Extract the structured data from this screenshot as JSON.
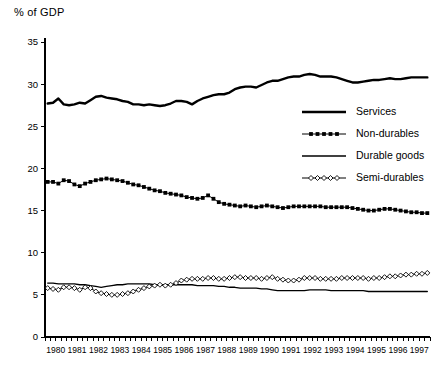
{
  "chart_data": {
    "type": "line",
    "title": "% of GDP",
    "xlabel": "",
    "ylabel": "% of GDP",
    "ylim": [
      0,
      35
    ],
    "yticks": [
      0,
      5,
      10,
      15,
      20,
      25,
      30,
      35
    ],
    "grid": false,
    "legend_position": "right-middle",
    "xtick_labels": [
      "1980",
      "1981",
      "1982",
      "1983",
      "1984",
      "1985",
      "1986",
      "1987",
      "1988",
      "1989",
      "1990",
      "1991",
      "1992",
      "1993",
      "1994",
      "1995",
      "1996",
      "1997"
    ],
    "x_minor_ticks_per_label": 4,
    "x": [
      "1980Q1",
      "1980Q2",
      "1980Q3",
      "1980Q4",
      "1981Q1",
      "1981Q2",
      "1981Q3",
      "1981Q4",
      "1982Q1",
      "1982Q2",
      "1982Q3",
      "1982Q4",
      "1983Q1",
      "1983Q2",
      "1983Q3",
      "1983Q4",
      "1984Q1",
      "1984Q2",
      "1984Q3",
      "1984Q4",
      "1985Q1",
      "1985Q2",
      "1985Q3",
      "1985Q4",
      "1986Q1",
      "1986Q2",
      "1986Q3",
      "1986Q4",
      "1987Q1",
      "1987Q2",
      "1987Q3",
      "1987Q4",
      "1988Q1",
      "1988Q2",
      "1988Q3",
      "1988Q4",
      "1989Q1",
      "1989Q2",
      "1989Q3",
      "1989Q4",
      "1990Q1",
      "1990Q2",
      "1990Q3",
      "1990Q4",
      "1991Q1",
      "1991Q2",
      "1991Q3",
      "1991Q4",
      "1992Q1",
      "1992Q2",
      "1992Q3",
      "1992Q4",
      "1993Q1",
      "1993Q2",
      "1993Q3",
      "1993Q4",
      "1994Q1",
      "1994Q2",
      "1994Q3",
      "1994Q4",
      "1995Q1",
      "1995Q2",
      "1995Q3",
      "1995Q4",
      "1996Q1",
      "1996Q2",
      "1996Q3",
      "1996Q4",
      "1997Q1",
      "1997Q2",
      "1997Q3",
      "1997Q4"
    ],
    "series": [
      {
        "name": "Services",
        "style": "thick-line",
        "values": [
          27.7,
          27.8,
          28.3,
          27.6,
          27.5,
          27.6,
          27.8,
          27.7,
          28.1,
          28.5,
          28.6,
          28.4,
          28.3,
          28.2,
          28.0,
          27.9,
          27.6,
          27.6,
          27.5,
          27.6,
          27.5,
          27.4,
          27.5,
          27.7,
          28.0,
          28.0,
          27.9,
          27.6,
          28.0,
          28.3,
          28.5,
          28.7,
          28.8,
          28.8,
          29.0,
          29.4,
          29.6,
          29.7,
          29.7,
          29.6,
          29.9,
          30.2,
          30.4,
          30.4,
          30.6,
          30.8,
          30.9,
          30.9,
          31.1,
          31.2,
          31.1,
          30.9,
          30.9,
          30.9,
          30.8,
          30.6,
          30.4,
          30.2,
          30.2,
          30.3,
          30.4,
          30.5,
          30.5,
          30.6,
          30.7,
          30.6,
          30.6,
          30.7,
          30.8,
          30.8,
          30.8,
          30.8
        ]
      },
      {
        "name": "Non-durables",
        "style": "line-filled-square",
        "values": [
          18.4,
          18.4,
          18.2,
          18.6,
          18.5,
          18.1,
          17.9,
          18.2,
          18.4,
          18.6,
          18.7,
          18.8,
          18.7,
          18.6,
          18.5,
          18.3,
          18.1,
          18.0,
          17.8,
          17.6,
          17.4,
          17.3,
          17.1,
          17.0,
          16.9,
          16.8,
          16.6,
          16.5,
          16.4,
          16.5,
          16.8,
          16.4,
          16.0,
          15.8,
          15.7,
          15.6,
          15.5,
          15.6,
          15.5,
          15.4,
          15.5,
          15.6,
          15.5,
          15.4,
          15.3,
          15.4,
          15.5,
          15.5,
          15.5,
          15.5,
          15.5,
          15.5,
          15.4,
          15.4,
          15.4,
          15.4,
          15.4,
          15.3,
          15.2,
          15.1,
          15.0,
          15.0,
          15.1,
          15.2,
          15.2,
          15.1,
          15.0,
          14.9,
          14.8,
          14.8,
          14.7,
          14.7
        ]
      },
      {
        "name": "Durable goods",
        "style": "thin-line",
        "values": [
          6.4,
          6.4,
          6.3,
          6.3,
          6.3,
          6.3,
          6.2,
          6.2,
          6.1,
          6.0,
          5.9,
          6.0,
          6.1,
          6.2,
          6.2,
          6.3,
          6.3,
          6.3,
          6.3,
          6.3,
          6.2,
          6.2,
          6.2,
          6.2,
          6.2,
          6.2,
          6.2,
          6.2,
          6.1,
          6.1,
          6.1,
          6.1,
          6.0,
          6.0,
          5.9,
          5.9,
          5.8,
          5.8,
          5.8,
          5.8,
          5.7,
          5.7,
          5.6,
          5.5,
          5.5,
          5.5,
          5.5,
          5.5,
          5.5,
          5.6,
          5.6,
          5.6,
          5.6,
          5.5,
          5.5,
          5.5,
          5.5,
          5.5,
          5.5,
          5.5,
          5.4,
          5.4,
          5.4,
          5.4,
          5.4,
          5.4,
          5.4,
          5.4,
          5.4,
          5.4,
          5.4,
          5.4
        ]
      },
      {
        "name": "Semi-durables",
        "style": "line-open-diamond",
        "values": [
          5.8,
          5.7,
          5.6,
          5.9,
          5.9,
          5.8,
          5.6,
          5.9,
          5.8,
          5.4,
          5.2,
          5.1,
          5.0,
          5.0,
          5.1,
          5.2,
          5.4,
          5.6,
          5.8,
          6.0,
          6.1,
          6.2,
          6.1,
          6.2,
          6.4,
          6.7,
          6.8,
          6.9,
          6.9,
          6.9,
          7.0,
          7.0,
          6.9,
          6.9,
          7.0,
          7.1,
          7.1,
          7.0,
          7.0,
          7.0,
          6.9,
          7.0,
          7.1,
          6.9,
          6.8,
          6.7,
          6.7,
          6.8,
          7.0,
          7.0,
          7.0,
          6.9,
          6.9,
          6.9,
          6.9,
          7.0,
          7.0,
          7.0,
          7.0,
          7.0,
          6.9,
          7.0,
          7.0,
          7.1,
          7.2,
          7.2,
          7.3,
          7.4,
          7.4,
          7.5,
          7.5,
          7.6
        ]
      }
    ]
  },
  "legend": {
    "items": [
      {
        "label": "Services"
      },
      {
        "label": "Non-durables"
      },
      {
        "label": "Durable goods"
      },
      {
        "label": "Semi-durables"
      }
    ]
  }
}
